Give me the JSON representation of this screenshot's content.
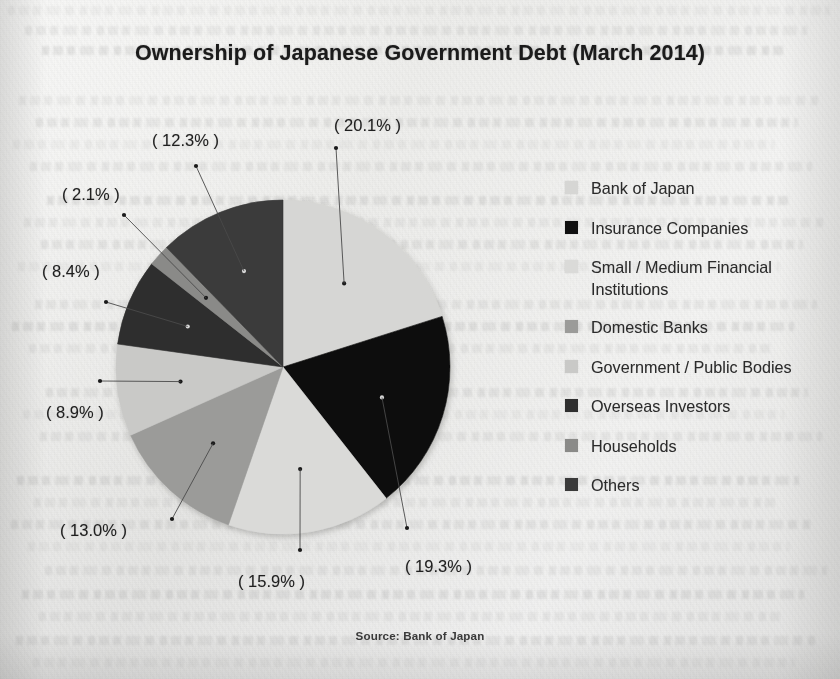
{
  "figure": {
    "title": "Ownership of Japanese Government Debt (March 2014)",
    "source_note": "Source: Bank of Japan"
  },
  "chart_data": {
    "type": "pie",
    "title": "Ownership of Japanese Government Debt (March 2014)",
    "source": "Source: Bank of Japan",
    "unit": "percent",
    "total": 100.0,
    "start_angle_deg": 0,
    "direction": "clockwise",
    "legend_position": "right",
    "categories": [
      "Bank of Japan",
      "Insurance Companies",
      "Small / Medium Financial Institutions",
      "Domestic Banks",
      "Government / Public Bodies",
      "Overseas Investors",
      "Households",
      "Others"
    ],
    "values": [
      20.1,
      19.3,
      15.9,
      13.0,
      8.9,
      8.4,
      2.1,
      12.3
    ],
    "labels": [
      "( 20.1% )",
      "( 19.3% )",
      "( 15.9% )",
      "( 13.0% )",
      "( 8.9% )",
      "( 8.4% )",
      "( 2.1% )",
      "( 12.3% )"
    ],
    "colors": [
      "#d6d6d4",
      "#101010",
      "#dadad8",
      "#9b9b99",
      "#c9c9c7",
      "#2f2f2f",
      "#8a8a88",
      "#3a3a3a"
    ],
    "slices": [
      {
        "name": "Bank of Japan",
        "value": 20.1,
        "label": "( 20.1% )",
        "color": "#d6d6d4"
      },
      {
        "name": "Insurance Companies",
        "value": 19.3,
        "label": "( 19.3% )",
        "color": "#101010"
      },
      {
        "name": "Small / Medium Financial Institutions",
        "value": 15.9,
        "label": "( 15.9% )",
        "color": "#dadad8"
      },
      {
        "name": "Domestic Banks",
        "value": 13.0,
        "label": "( 13.0% )",
        "color": "#9b9b99"
      },
      {
        "name": "Government / Public Bodies",
        "value": 8.9,
        "label": "( 8.9% )",
        "color": "#c9c9c7"
      },
      {
        "name": "Overseas Investors",
        "value": 8.4,
        "label": "( 8.4% )",
        "color": "#2f2f2f"
      },
      {
        "name": "Households",
        "value": 2.1,
        "label": "( 2.1% )",
        "color": "#8a8a88"
      },
      {
        "name": "Others",
        "value": 12.3,
        "label": "( 12.3% )",
        "color": "#3a3a3a"
      }
    ]
  },
  "legend": {
    "items": [
      {
        "label": "Bank of Japan",
        "color": "#d6d6d4"
      },
      {
        "label": "Insurance Companies",
        "color": "#101010"
      },
      {
        "label": "Small / Medium Financial Institutions",
        "color": "#dadad8"
      },
      {
        "label": "Domestic Banks",
        "color": "#9b9b99"
      },
      {
        "label": "Government / Public Bodies",
        "color": "#c9c9c7"
      },
      {
        "label": "Overseas Investors",
        "color": "#2f2f2f"
      },
      {
        "label": "Households",
        "color": "#8a8a88"
      },
      {
        "label": "Others",
        "color": "#3a3a3a"
      }
    ]
  }
}
